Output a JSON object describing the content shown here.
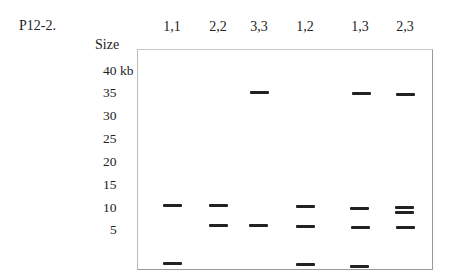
{
  "figure": {
    "title": "P12-2.",
    "size_label": "Size",
    "axis_ticks": [
      {
        "label": "40 kb",
        "y": 72
      },
      {
        "label": "35",
        "y": 94
      },
      {
        "label": "30",
        "y": 117
      },
      {
        "label": "25",
        "y": 140
      },
      {
        "label": "20",
        "y": 163
      },
      {
        "label": "15",
        "y": 186
      },
      {
        "label": "10",
        "y": 209
      },
      {
        "label": "5",
        "y": 231
      }
    ],
    "lanes": [
      {
        "label": "1,1",
        "x": 172
      },
      {
        "label": "2,2",
        "x": 218
      },
      {
        "label": "3,3",
        "x": 259
      },
      {
        "label": "1,2",
        "x": 305
      },
      {
        "label": "1,3",
        "x": 360
      },
      {
        "label": "2,3",
        "x": 405
      }
    ]
  },
  "chart_data": {
    "type": "gel",
    "title": "P12-2.",
    "ylabel": "Size",
    "yunit": "kb",
    "ytick_labels": [
      "40 kb",
      "35",
      "30",
      "25",
      "20",
      "15",
      "10",
      "5"
    ],
    "lanes": [
      "1,1",
      "2,2",
      "3,3",
      "1,2",
      "1,3",
      "2,3"
    ],
    "bands": [
      {
        "lane": "1,1",
        "sizes_kb_approx": [
          12,
          1
        ]
      },
      {
        "lane": "2,2",
        "sizes_kb_approx": [
          12,
          8
        ]
      },
      {
        "lane": "3,3",
        "sizes_kb_approx": [
          37,
          8
        ]
      },
      {
        "lane": "1,2",
        "sizes_kb_approx": [
          12,
          8,
          1
        ]
      },
      {
        "lane": "1,3",
        "sizes_kb_approx": [
          37,
          12,
          8,
          1
        ]
      },
      {
        "lane": "2,3",
        "sizes_kb_approx": [
          37,
          12,
          11,
          8
        ]
      }
    ]
  },
  "bands_px": [
    {
      "x": 163,
      "y": 204
    },
    {
      "x": 163,
      "y": 262
    },
    {
      "x": 209,
      "y": 204
    },
    {
      "x": 209,
      "y": 224
    },
    {
      "x": 250,
      "y": 91
    },
    {
      "x": 249,
      "y": 224
    },
    {
      "x": 296,
      "y": 205
    },
    {
      "x": 296,
      "y": 225
    },
    {
      "x": 296,
      "y": 263
    },
    {
      "x": 352,
      "y": 92
    },
    {
      "x": 350,
      "y": 207
    },
    {
      "x": 351,
      "y": 226
    },
    {
      "x": 350,
      "y": 265
    },
    {
      "x": 396,
      "y": 93
    },
    {
      "x": 395,
      "y": 206
    },
    {
      "x": 395,
      "y": 211
    },
    {
      "x": 396,
      "y": 226
    }
  ]
}
